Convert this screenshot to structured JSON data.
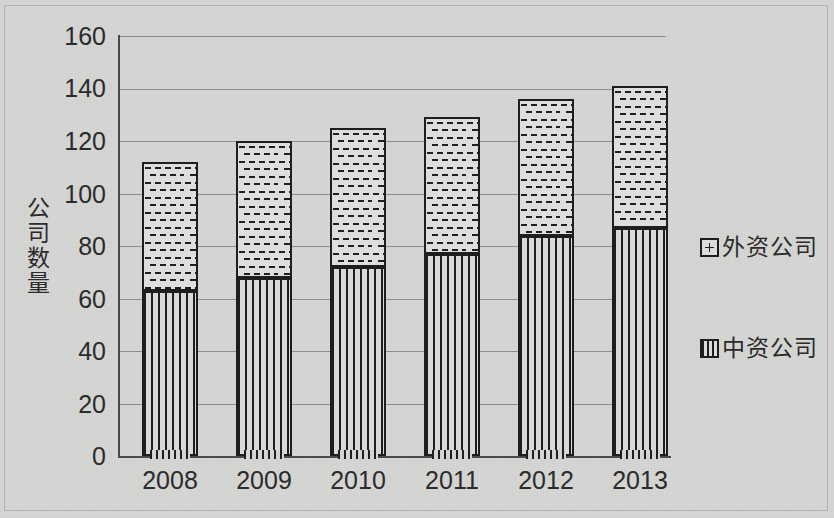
{
  "chart_data": {
    "type": "bar",
    "subtype": "stacked-column",
    "title": "",
    "xlabel": "",
    "ylabel": "公司数量",
    "categories": [
      "2008",
      "2009",
      "2010",
      "2011",
      "2012",
      "2013"
    ],
    "series": [
      {
        "name": "中资公司",
        "pattern": "vertical-stripes",
        "stack_position": "bottom",
        "values": [
          63,
          68,
          72,
          77,
          84,
          87
        ]
      },
      {
        "name": "外资公司",
        "pattern": "dotted-brick",
        "stack_position": "top",
        "values": [
          49,
          52,
          53,
          52,
          52,
          54
        ]
      }
    ],
    "totals": [
      112,
      120,
      125,
      129,
      136,
      141
    ],
    "ylim": [
      0,
      160
    ],
    "ytick_values": [
      0,
      20,
      40,
      60,
      80,
      100,
      120,
      140,
      160
    ],
    "ytick_labels": [
      "0",
      "20",
      "40",
      "60",
      "80",
      "100",
      "120",
      "140",
      "160"
    ],
    "grid": true,
    "grid_axis": "y",
    "legend_position": "right",
    "legend": [
      "外资公司",
      "中资公司"
    ]
  },
  "colors": {
    "background": "#d6d6d4",
    "axis": "#49494a",
    "gridline": "#8d8d8b",
    "bar_outline": "#1e1e1e",
    "text": "#2b2b2b",
    "fill_light": "#dedede"
  }
}
